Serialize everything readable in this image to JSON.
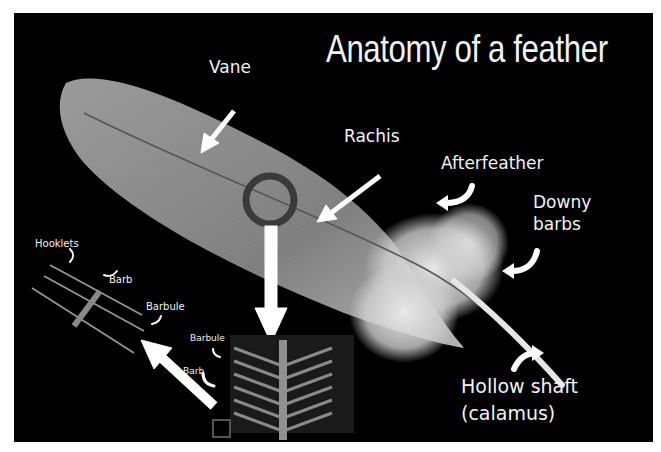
{
  "title": "Anatomy of a feather",
  "labels": {
    "vane": "Vane",
    "rachis": "Rachis",
    "afterfeather": "Afterfeather",
    "downy_barbs_line1": "Downy",
    "downy_barbs_line2": "barbs",
    "hollow_shaft_line1": "Hollow shaft",
    "hollow_shaft_line2": "(calamus)",
    "hooklets": "Hooklets",
    "barb_upper": "Barb",
    "barbule_upper": "Barbule",
    "barbule_lower": "Barbule",
    "barb_lower": "Barb"
  },
  "colors": {
    "background": "#000000",
    "frame": "#ffffff",
    "text": "#f2f2f2",
    "magnifier_ring": "#3a3a3a",
    "feather": "#8c8c8c",
    "arrow": "#ffffff"
  }
}
